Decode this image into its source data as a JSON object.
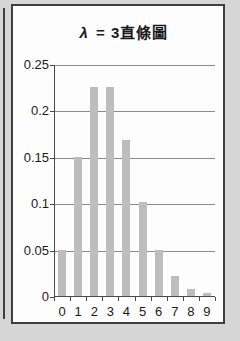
{
  "colors": {
    "background": "#d6d6d6",
    "card_background": "#fdfdfd",
    "card_border": "#3f3f3f",
    "bar": "#bdbdbd",
    "gridline": "#8c8c8c",
    "axis": "#4a4a4a",
    "text": "#1a1a1a"
  },
  "chart_data": {
    "type": "bar",
    "title": "λ = 3直條圖",
    "title_lambda": "λ",
    "title_rest": "= 3直條圖",
    "categories": [
      "0",
      "1",
      "2",
      "3",
      "4",
      "5",
      "6",
      "7",
      "8",
      "9"
    ],
    "values": [
      0.05,
      0.15,
      0.225,
      0.225,
      0.168,
      0.101,
      0.05,
      0.022,
      0.008,
      0.003
    ],
    "xlabel": "",
    "ylabel": "",
    "ylim": [
      0,
      0.25
    ],
    "y_ticks": [
      0,
      0.05,
      0.1,
      0.15,
      0.2,
      0.25
    ],
    "y_tick_labels": [
      "0",
      "0.05",
      "0.1",
      "0.15",
      "0.2",
      "0.25"
    ],
    "grid": true,
    "legend": false
  }
}
